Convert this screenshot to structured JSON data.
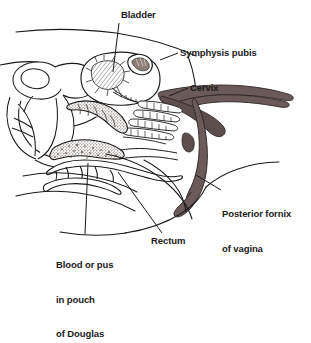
{
  "figure": {
    "background_color": "#ffffff",
    "line_color": "#1a1a1a",
    "organ_fill_color": "#6b5a5a",
    "organ_fill_dark": "#4f4242",
    "stipple_color": "#7a6a64",
    "label_color": "#1a1a1a"
  },
  "labels": {
    "bladder": "Bladder",
    "symphysis_pubis": "Symphysis pubis",
    "cervix": "Cervix",
    "posterior_fornix_line1": "Posterior fornix",
    "posterior_fornix_line2": "of vagina",
    "rectum": "Rectum",
    "blood_or_pus_line1": "Blood or pus",
    "blood_or_pus_line2": "in pouch",
    "blood_or_pus_line3": "of Douglas"
  }
}
